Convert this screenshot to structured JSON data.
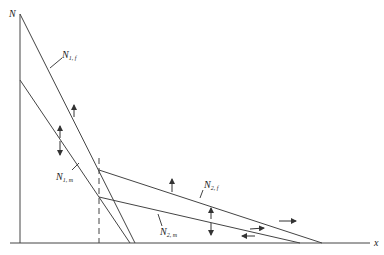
{
  "diagram": {
    "axes": {
      "y_label": "N",
      "x_label": "x"
    },
    "curves": [
      {
        "id": "N1f",
        "label": "N",
        "subscript": "1, f"
      },
      {
        "id": "N1m",
        "label": "N",
        "subscript": "1, m"
      },
      {
        "id": "N2f",
        "label": "N",
        "subscript": "2, f"
      },
      {
        "id": "N2m",
        "label": "N",
        "subscript": "2, m"
      }
    ],
    "colors": {
      "line": "#444444",
      "background": "#ffffff"
    }
  }
}
